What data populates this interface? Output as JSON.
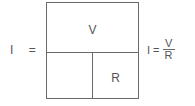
{
  "diagram": {
    "left_expression": "I =",
    "cells": {
      "top": "V",
      "bottom_left": "",
      "bottom_right": "R"
    },
    "formula": {
      "lhs": "I =",
      "numerator": "V",
      "denominator": "R"
    },
    "line_color": "#6a6a6a",
    "text_color": "#555555"
  }
}
